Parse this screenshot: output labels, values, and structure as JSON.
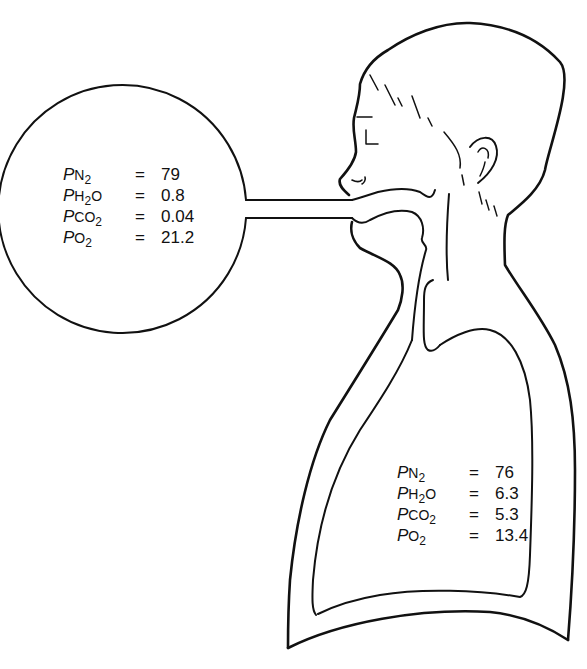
{
  "diagram": {
    "type": "anatomical-schematic",
    "colors": {
      "line": "#111111",
      "background": "#ffffff"
    },
    "atmosphere": {
      "shape": "circle",
      "rows": [
        {
          "prefix": "P",
          "gas_main": "N",
          "gas_sub": "2",
          "gas_tail": "",
          "equals": "=",
          "value": "79"
        },
        {
          "prefix": "P",
          "gas_main": "H",
          "gas_sub": "2",
          "gas_tail": "O",
          "equals": "=",
          "value": "0.8"
        },
        {
          "prefix": "P",
          "gas_main": "CO",
          "gas_sub": "2",
          "gas_tail": "",
          "equals": "=",
          "value": "0.04"
        },
        {
          "prefix": "P",
          "gas_main": "O",
          "gas_sub": "2",
          "gas_tail": "",
          "equals": "=",
          "value": "21.2"
        }
      ]
    },
    "alveolar": {
      "location": "inside lung",
      "rows": [
        {
          "prefix": "P",
          "gas_main": "N",
          "gas_sub": "2",
          "gas_tail": "",
          "equals": "=",
          "value": "76"
        },
        {
          "prefix": "P",
          "gas_main": "H",
          "gas_sub": "2",
          "gas_tail": "O",
          "equals": "=",
          "value": "6.3"
        },
        {
          "prefix": "P",
          "gas_main": "CO",
          "gas_sub": "2",
          "gas_tail": "",
          "equals": "=",
          "value": "5.3"
        },
        {
          "prefix": "P",
          "gas_main": "O",
          "gas_sub": "2",
          "gas_tail": "",
          "equals": "=",
          "value": "13.4"
        }
      ]
    },
    "nodes": [
      "atmosphere-circle",
      "connecting-tube",
      "head",
      "mouth",
      "airway-trachea",
      "lung",
      "thorax-outline"
    ],
    "edges": [
      {
        "from": "atmosphere-circle",
        "to": "mouth",
        "via": "connecting-tube"
      },
      {
        "from": "mouth",
        "to": "airway-trachea"
      },
      {
        "from": "airway-trachea",
        "to": "lung"
      }
    ]
  }
}
